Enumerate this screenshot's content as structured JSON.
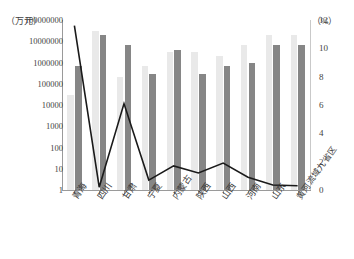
{
  "chart_data": {
    "type": "bar",
    "title": "",
    "categories": [
      "青海",
      "四川",
      "甘肃",
      "宁夏",
      "内蒙古",
      "陕西",
      "山西",
      "河南",
      "山东",
      "黄河流域九省区"
    ],
    "series": [
      {
        "name": "series-1",
        "axis": "left",
        "color": "#e9e9e9",
        "values": [
          30000,
          30000000,
          200000,
          700000,
          3000000,
          3000000,
          2000000,
          7000000,
          20000000,
          20000000
        ]
      },
      {
        "name": "series-2",
        "axis": "left",
        "color": "#868686",
        "values": [
          700000,
          20000000,
          7000000,
          300000,
          4000000,
          300000,
          700000,
          1000000,
          7000000,
          7000000
        ]
      },
      {
        "name": "series-3-line",
        "axis": "right",
        "color": "#1a1a1a",
        "values": [
          11.6,
          0.2,
          6.1,
          0.7,
          1.7,
          1.2,
          1.9,
          0.9,
          0.35,
          0.3
        ]
      }
    ],
    "ylabel_left": "（万元）",
    "ylabel_right": "（%）",
    "xlabel": "",
    "yticks_left": [
      "100000000",
      "10000000",
      "1000000",
      "100000",
      "10000",
      "1000",
      "100",
      "10",
      "1"
    ],
    "yticks_left_values": [
      100000000,
      10000000,
      1000000,
      100000,
      10000,
      1000,
      100,
      10,
      1
    ],
    "yticks_right": [
      "12",
      "10",
      "8",
      "6",
      "4",
      "2",
      "0"
    ],
    "yticks_right_values": [
      12,
      10,
      8,
      6,
      4,
      2,
      0
    ],
    "ylim_left": [
      1,
      100000000
    ],
    "ylim_right": [
      0,
      12
    ],
    "yscale_left": "log",
    "grid": false,
    "legend": "none"
  }
}
